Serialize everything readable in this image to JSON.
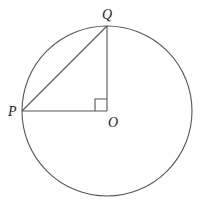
{
  "diagram": {
    "type": "circle-geometry",
    "circle": {
      "center_label": "O",
      "cx": 107,
      "cy": 111,
      "r": 85
    },
    "points": [
      {
        "id": "P",
        "label": "P",
        "x": 22,
        "y": 111,
        "label_x": 8,
        "label_y": 116
      },
      {
        "id": "Q",
        "label": "Q",
        "x": 107,
        "y": 26,
        "label_x": 102,
        "label_y": 19
      },
      {
        "id": "O",
        "label": "O",
        "x": 107,
        "y": 111,
        "label_x": 108,
        "label_y": 126
      }
    ],
    "segments": [
      {
        "from": "P",
        "to": "Q"
      },
      {
        "from": "Q",
        "to": "O"
      },
      {
        "from": "P",
        "to": "O"
      }
    ],
    "right_angle": {
      "at": "O",
      "size": 12
    },
    "colors": {
      "stroke": "#555555",
      "label": "#222222",
      "background": "#ffffff"
    }
  }
}
